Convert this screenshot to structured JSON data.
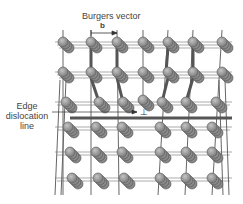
{
  "diagram": {
    "title": "Burgers vector",
    "vector_symbol": "b",
    "edge_label_lines": [
      "Edge",
      "dislocation",
      "line"
    ],
    "dislocation_symbol": "⊥",
    "colors": {
      "atom_fill": "#8a8a8a",
      "atom_stroke": "#555555",
      "bond": "#777777",
      "text": "#444444"
    },
    "lattice": {
      "top_rows": 2,
      "bottom_rows": 3,
      "columns_top": 7,
      "columns_bottom": 6
    }
  }
}
